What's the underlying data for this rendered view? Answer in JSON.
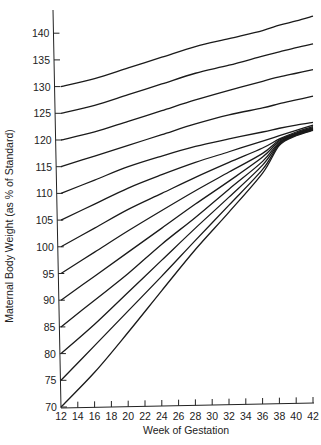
{
  "chart_data": {
    "type": "line",
    "title": "",
    "xlabel": "Week of Gestation",
    "ylabel": "Maternal Body Weight (as % of Standard)",
    "xlim": [
      12,
      42
    ],
    "ylim": [
      70,
      145
    ],
    "grid": false,
    "legend": "none",
    "x_ticks": [
      12,
      14,
      16,
      18,
      20,
      22,
      24,
      26,
      28,
      30,
      32,
      34,
      36,
      38,
      40,
      42
    ],
    "y_ticks": [
      70,
      75,
      80,
      85,
      90,
      95,
      100,
      105,
      110,
      115,
      120,
      125,
      130,
      135,
      140
    ],
    "x": [
      12,
      16,
      20,
      24,
      28,
      32,
      36,
      38,
      40,
      42
    ],
    "series": [
      {
        "name": "Start 130%",
        "values": [
          130,
          131.5,
          133.5,
          135.5,
          137.5,
          139,
          140.5,
          141.5,
          142.3,
          143.2
        ]
      },
      {
        "name": "Start 125%",
        "values": [
          125,
          126.5,
          128.5,
          130.5,
          132.5,
          134,
          135.7,
          136.5,
          137.3,
          138
        ]
      },
      {
        "name": "Start 120%",
        "values": [
          120,
          121.5,
          123.5,
          125.5,
          127.5,
          129.3,
          131,
          131.8,
          132.5,
          133.2
        ]
      },
      {
        "name": "Start 115%",
        "values": [
          115,
          117,
          119,
          121,
          123,
          124.7,
          126,
          126.8,
          127.5,
          128.2
        ]
      },
      {
        "name": "Start 110%",
        "values": [
          110,
          112.5,
          115,
          117,
          118.8,
          120.2,
          121.5,
          122.2,
          122.8,
          123.3
        ]
      },
      {
        "name": "Start 105%",
        "values": [
          105,
          108,
          111,
          113.5,
          115.8,
          117.8,
          119.8,
          120.8,
          121.8,
          122.8
        ]
      },
      {
        "name": "Start 100%",
        "values": [
          100,
          103.5,
          107,
          110,
          113,
          115.8,
          118.5,
          120.2,
          121.5,
          122.5
        ]
      },
      {
        "name": "Start 95%",
        "values": [
          95,
          99,
          103,
          106.8,
          110.5,
          114,
          117.5,
          120,
          121.3,
          122.3
        ]
      },
      {
        "name": "Start 90%",
        "values": [
          90,
          94.5,
          99,
          103.5,
          108,
          112.3,
          116.8,
          119.8,
          121.2,
          122.2
        ]
      },
      {
        "name": "Start 85%",
        "values": [
          85,
          90,
          95,
          100.5,
          105.5,
          110.8,
          116,
          119.6,
          121.1,
          122.1
        ]
      },
      {
        "name": "Start 80%",
        "values": [
          80,
          85.5,
          91.5,
          97.5,
          103.5,
          109.3,
          115.3,
          119.4,
          121,
          122
        ]
      },
      {
        "name": "Start 75%",
        "values": [
          75,
          81.5,
          88,
          94.5,
          101.2,
          107.8,
          114.5,
          119.2,
          120.9,
          121.9
        ]
      },
      {
        "name": "Start 70%",
        "values": [
          70,
          76.5,
          84,
          91.8,
          99.5,
          106.5,
          113.8,
          119,
          120.8,
          121.8
        ]
      }
    ]
  },
  "labels": {
    "xlabel": "Week of Gestation",
    "ylabel": "Maternal Body Weight (as % of Standard)"
  }
}
